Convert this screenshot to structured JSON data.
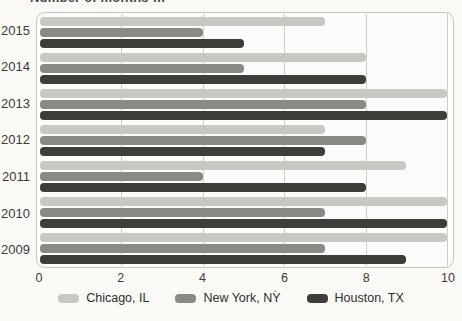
{
  "chart_data": {
    "type": "bar",
    "orientation": "horizontal",
    "title": "Number of months …",
    "title_note": "title is cropped at top edge of screenshot; only bottom sliver of the text row is visible",
    "categories": [
      "2015",
      "2014",
      "2013",
      "2012",
      "2011",
      "2010",
      "2009"
    ],
    "series": [
      {
        "name": "Chicago, IL",
        "color": "#c9c7c3",
        "values": [
          7,
          8,
          10,
          7,
          9,
          10,
          10
        ]
      },
      {
        "name": "New York, NY",
        "color": "#8b8986",
        "values": [
          4,
          5,
          8,
          8,
          4,
          7,
          7
        ]
      },
      {
        "name": "Houston, TX",
        "color": "#3f3d3a",
        "values": [
          5,
          8,
          10,
          7,
          8,
          10,
          9
        ]
      }
    ],
    "xlim": [
      0,
      10
    ],
    "xticks": [
      0,
      2,
      4,
      6,
      8,
      10
    ],
    "xlabel": "",
    "ylabel": "",
    "grid": true,
    "gridline_color": "#d2cec7",
    "plot_border_color": "#c7c3bc",
    "background_color": "#fbf9f6",
    "legend_position": "bottom"
  }
}
